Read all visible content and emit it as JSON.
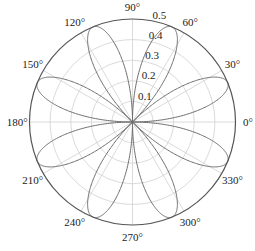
{
  "chart_data": {
    "type": "line",
    "projection": "polar",
    "title": "",
    "function": "r = sin(2θ)·cos(2θ) = 0.5·sin(4θ) (|r| plotted, 8 petals)",
    "rlim": [
      0,
      0.5
    ],
    "r_ticks": [
      0.1,
      0.2,
      0.3,
      0.4,
      0.5
    ],
    "r_tick_labels": [
      "0.1",
      "0.2",
      "0.3",
      "0.4",
      "0.5"
    ],
    "r_label_angle_deg": 80,
    "theta_ticks_deg": [
      0,
      30,
      60,
      90,
      120,
      150,
      180,
      210,
      240,
      270,
      300,
      330
    ],
    "theta_tick_labels": [
      "0°",
      "30°",
      "60°",
      "90°",
      "120°",
      "150°",
      "180°",
      "210°",
      "240°",
      "270°",
      "300°",
      "330°"
    ],
    "grid": true,
    "petal_count": 8,
    "petal_directions_deg": [
      22.5,
      67.5,
      112.5,
      157.5,
      202.5,
      247.5,
      292.5,
      337.5
    ],
    "petal_max_r": 0.5,
    "series": [
      {
        "name": "rose curve",
        "theta_deg": [
          0,
          11.25,
          22.5,
          33.75,
          45,
          56.25,
          67.5,
          78.75,
          90,
          101.25,
          112.5,
          123.75,
          135,
          146.25,
          157.5,
          168.75,
          180,
          191.25,
          202.5,
          213.75,
          225,
          236.25,
          247.5,
          258.75,
          270,
          281.25,
          292.5,
          303.75,
          315,
          326.25,
          337.5,
          348.75,
          360
        ],
        "r": [
          0,
          0.354,
          0.5,
          0.354,
          0,
          0.354,
          0.5,
          0.354,
          0,
          0.354,
          0.5,
          0.354,
          0,
          0.354,
          0.5,
          0.354,
          0,
          0.354,
          0.5,
          0.354,
          0,
          0.354,
          0.5,
          0.354,
          0,
          0.354,
          0.5,
          0.354,
          0,
          0.354,
          0.5,
          0.354,
          0
        ]
      }
    ],
    "colors": {
      "curve": "#6e6e6e",
      "grid": "#d0d0d0",
      "frame": "#555555",
      "text": "#222222"
    }
  }
}
